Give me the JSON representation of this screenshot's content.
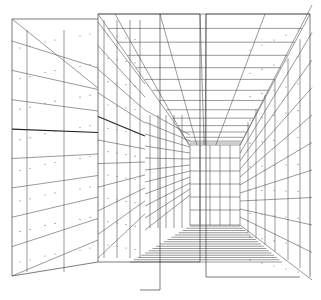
{
  "diagram": {
    "type": "architectural-perspective-line-drawing",
    "colors": {
      "background": "#ffffff",
      "line": "#555555",
      "dark_line": "#222222",
      "tie_hole_dot": "#777777"
    },
    "vanishing_point": {
      "x": 205,
      "y": 160
    },
    "back_wall": {
      "x1": 190,
      "y1": 145,
      "x2": 240,
      "y2": 225
    },
    "panels": [
      {
        "name": "left-wall-panel",
        "x": 12,
        "top": 19,
        "bottom": 276,
        "right_x": 98
      },
      {
        "name": "center-left-panel",
        "x": 98,
        "top": 14,
        "bottom": 262,
        "right_x": 200
      },
      {
        "name": "center-right-panel",
        "x": 206,
        "top": 14,
        "bottom": 262,
        "right_x": 310
      },
      {
        "name": "right-wall-panel",
        "x": 290,
        "top": 14,
        "bottom": 277
      }
    ],
    "ceiling_rows": 14,
    "floor_rows": 16,
    "wall_rows": 8
  }
}
